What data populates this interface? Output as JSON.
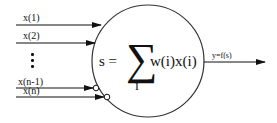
{
  "diagram": {
    "title": "",
    "type": "artificial neuron (perceptron) model",
    "inputs": [
      {
        "label": "x(1)",
        "terminal": "arrow"
      },
      {
        "label": "x(2)",
        "terminal": "arrow"
      },
      {
        "label": "x(n-1)",
        "terminal": "arrow-with-circle"
      },
      {
        "label": "x(n)",
        "terminal": "arrow-with-circle"
      }
    ],
    "ellipsis": "⋮",
    "node": {
      "lhs": "s =",
      "sigma": "∑",
      "index": "i",
      "term": "w(i)x(i)"
    },
    "output": {
      "label": "y=f(s)"
    },
    "colors": {
      "stroke": "#111111",
      "background": "#ffffff"
    }
  }
}
